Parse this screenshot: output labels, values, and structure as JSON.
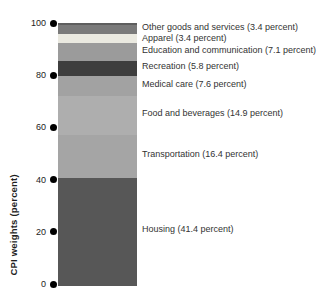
{
  "chart_data": {
    "type": "bar",
    "stacked": true,
    "orientation": "vertical",
    "title": "",
    "ylabel": "CPI weights (percent)",
    "xlabel": "",
    "ylim": [
      0,
      100
    ],
    "yticks": [
      0,
      20,
      40,
      60,
      80,
      100
    ],
    "grid": false,
    "legend_position": "labels-right-of-bar",
    "tick_marker": "filled-circle",
    "segments_top_to_bottom": [
      {
        "category": "Other goods and services",
        "value": 3.4,
        "label": "Other goods and services (3.4 percent)",
        "color": "#7a7a7a"
      },
      {
        "category": "Apparel",
        "value": 3.4,
        "label": "Apparel (3.4 percent)",
        "color": "#eae9e0"
      },
      {
        "category": "Education and communication",
        "value": 7.1,
        "label": "Education and communication (7.1 percent)",
        "color": "#9b9b9b"
      },
      {
        "category": "Recreation",
        "value": 5.8,
        "label": "Recreation (5.8 percent)",
        "color": "#3e3e3e"
      },
      {
        "category": "Medical care",
        "value": 7.6,
        "label": "Medical care (7.6 percent)",
        "color": "#a2a2a2"
      },
      {
        "category": "Food and beverages",
        "value": 14.9,
        "label": "Food and beverages (14.9 percent)",
        "color": "#aeaeae"
      },
      {
        "category": "Transportation",
        "value": 16.4,
        "label": "Transportation (16.4 percent)",
        "color": "#a5a5a5"
      },
      {
        "category": "Housing",
        "value": 41.4,
        "label": "Housing (41.4 percent)",
        "color": "#575757"
      }
    ]
  }
}
